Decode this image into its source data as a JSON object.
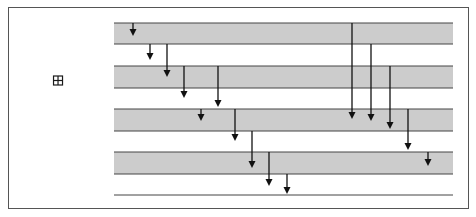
{
  "diagram": {
    "type": "state-transition-timeline",
    "states": [
      {
        "label": "Placed",
        "y": 23,
        "expandable": false
      },
      {
        "label": "Checked",
        "y": 44,
        "expandable": false
      },
      {
        "label": "Confirmed",
        "y": 66,
        "expandable": false
      },
      {
        "label": "Denied",
        "y": 88,
        "expandable": true,
        "icon": "expand-plus-box-icon"
      },
      {
        "label": "Awaiting Delivery",
        "y": 109,
        "expandable": false
      },
      {
        "label": "Delivered",
        "y": 131,
        "expandable": false
      },
      {
        "label": "Returned",
        "y": 152,
        "expandable": false
      },
      {
        "label": "Canceled",
        "y": 174,
        "expandable": false
      },
      {
        "label": "Archived",
        "y": 195,
        "expandable": false
      }
    ],
    "bands": [
      {
        "from": "Placed",
        "to": "Checked"
      },
      {
        "from": "Confirmed",
        "to": "Denied"
      },
      {
        "from": "Awaiting Delivery",
        "to": "Delivered"
      },
      {
        "from": "Returned",
        "to": "Canceled"
      }
    ],
    "arrows": [
      {
        "x": 133,
        "y1": 23,
        "y2": 36
      },
      {
        "x": 150,
        "y1": 44,
        "y2": 60
      },
      {
        "x": 167,
        "y1": 44,
        "y2": 77
      },
      {
        "x": 184,
        "y1": 66,
        "y2": 98
      },
      {
        "x": 218,
        "y1": 66,
        "y2": 107
      },
      {
        "x": 201,
        "y1": 109,
        "y2": 121
      },
      {
        "x": 235,
        "y1": 109,
        "y2": 141
      },
      {
        "x": 252,
        "y1": 131,
        "y2": 168
      },
      {
        "x": 269,
        "y1": 152,
        "y2": 186
      },
      {
        "x": 287,
        "y1": 174,
        "y2": 194
      },
      {
        "x": 352,
        "y1": 23,
        "y2": 119
      },
      {
        "x": 371,
        "y1": 44,
        "y2": 121
      },
      {
        "x": 390,
        "y1": 66,
        "y2": 129
      },
      {
        "x": 408,
        "y1": 109,
        "y2": 150
      },
      {
        "x": 428,
        "y1": 152,
        "y2": 166
      }
    ],
    "colors": {
      "band": "#cccccc",
      "line": "#444444",
      "arrow": "#111111",
      "text": "#1a1a1a"
    },
    "line_x_start": 114,
    "line_x_end": 453
  }
}
